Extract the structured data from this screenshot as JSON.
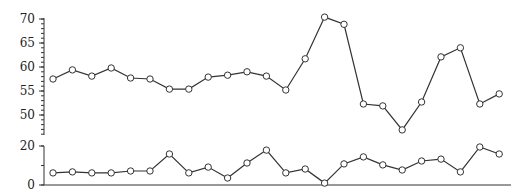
{
  "chart_data": [
    {
      "type": "line",
      "panel": "top",
      "title": "",
      "xlabel": "",
      "ylabel": "",
      "ylim": [
        45.8,
        70.4
      ],
      "yticks": [
        50,
        55,
        60,
        65,
        70
      ],
      "minor_ticks_per_major": 5,
      "grid": false,
      "marker": "open-circle",
      "x": [
        1,
        2,
        3,
        4,
        5,
        6,
        7,
        8,
        9,
        10,
        11,
        12,
        13,
        14,
        15,
        16,
        17,
        18,
        19,
        20,
        21,
        22,
        23,
        24
      ],
      "values": [
        57.5,
        59.4,
        58.1,
        59.8,
        57.7,
        57.5,
        55.4,
        55.4,
        57.9,
        58.3,
        59.0,
        58.1,
        55.2,
        61.7,
        70.4,
        68.9,
        52.3,
        51.9,
        46.9,
        52.7,
        62.1,
        64.0,
        52.3,
        54.4
      ]
    },
    {
      "type": "line",
      "panel": "bottom",
      "title": "",
      "xlabel": "",
      "ylabel": "",
      "ylim": [
        0,
        20
      ],
      "yticks": [
        0,
        20
      ],
      "minor_ticks_per_major": 2,
      "grid": false,
      "marker": "open-circle",
      "x": [
        1,
        2,
        3,
        4,
        5,
        6,
        7,
        8,
        9,
        10,
        11,
        12,
        13,
        14,
        15,
        16,
        17,
        18,
        19,
        20,
        21,
        22,
        23,
        24
      ],
      "values": [
        6.2,
        6.7,
        6.2,
        6.2,
        7.2,
        7.2,
        15.9,
        6.2,
        9.2,
        3.6,
        11.3,
        17.9,
        6.2,
        8.2,
        1.0,
        10.8,
        14.4,
        10.3,
        7.7,
        12.3,
        13.3,
        6.7,
        19.5,
        15.9
      ]
    }
  ],
  "layout": {
    "x_start": 53,
    "x_step": 19.4,
    "top": {
      "y_at_max": 19,
      "max": 70,
      "y_at_min": 115,
      "min": 50,
      "axis_top": 18,
      "axis_bottom": 135
    },
    "bottom": {
      "y_at_max": 146,
      "max": 20,
      "y_at_min": 185,
      "min": 0,
      "axis_top": 146,
      "axis_bottom": 185
    },
    "axis_x": 44,
    "baseline_right": 511
  },
  "colors": {
    "line": "#333333",
    "marker_fill": "#ffffff",
    "text": "#222222"
  }
}
